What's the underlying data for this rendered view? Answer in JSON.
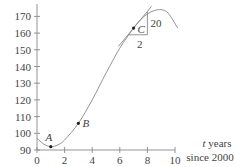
{
  "chart_data": {
    "type": "line",
    "title": "",
    "xlabel": "t years since 2000",
    "xlabel_lines": [
      "t years",
      "since 2000"
    ],
    "ylabel": "",
    "xlim": [
      0,
      10
    ],
    "ylim": [
      90,
      175
    ],
    "x_ticks": [
      0,
      2,
      4,
      6,
      8,
      10
    ],
    "y_ticks": [
      90,
      100,
      110,
      120,
      130,
      140,
      150,
      160,
      170
    ],
    "grid": false,
    "legend": null,
    "series": [
      {
        "name": "curve",
        "x": [
          0,
          0.5,
          1,
          1.5,
          2,
          3,
          4,
          5,
          6,
          7,
          7.5,
          8,
          8.5,
          9,
          9.5,
          10.2
        ],
        "values": [
          97,
          93.5,
          92,
          93,
          96,
          106,
          120,
          136,
          151,
          163,
          168,
          171.5,
          173.5,
          174,
          172,
          163
        ]
      }
    ],
    "points": [
      {
        "label": "A",
        "t": 1,
        "y": 92
      },
      {
        "label": "B",
        "t": 3,
        "y": 106
      },
      {
        "label": "C",
        "t": 7,
        "y": 163
      }
    ],
    "tangent": {
      "through_point": "C",
      "slope": 10,
      "run_label": "2",
      "rise_label": "20"
    }
  }
}
